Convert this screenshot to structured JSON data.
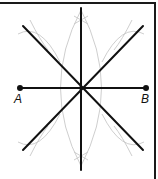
{
  "diagram": {
    "type": "geometric-construction",
    "points": [
      {
        "label": "A",
        "x": 20,
        "y": 88
      },
      {
        "label": "B",
        "x": 146,
        "y": 88
      }
    ],
    "center": {
      "x": 81,
      "y": 88
    },
    "colors": {
      "line": "#111111",
      "arc": "#c8c8c8",
      "frame": "#1a1a1a"
    }
  }
}
